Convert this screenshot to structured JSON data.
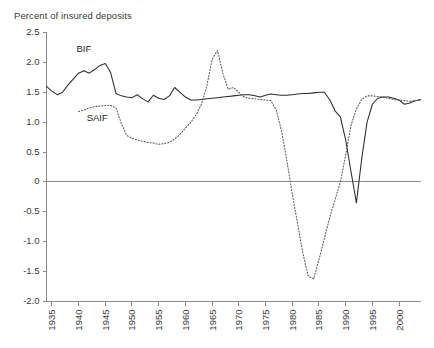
{
  "chart_data": {
    "type": "line",
    "title": "Percent of insured deposits",
    "xlabel": "",
    "ylabel": "Percent of insured deposits",
    "xlim": [
      1934,
      2004
    ],
    "ylim": [
      -2.0,
      2.5
    ],
    "grid": false,
    "legend_position": "inline-annotations",
    "yticks": [
      "2.5",
      "2.0",
      "1.5",
      "1.0",
      "0.5",
      "0",
      "-0.5",
      "-1.0",
      "-1.5",
      "-2.0"
    ],
    "ytick_values": [
      2.5,
      2.0,
      1.5,
      1.0,
      0.5,
      0,
      -0.5,
      -1.0,
      -1.5,
      -2.0
    ],
    "xticks": [
      "1935",
      "1940",
      "1945",
      "1950",
      "1955",
      "1960",
      "1965",
      "1970",
      "1975",
      "1980",
      "1985",
      "1990",
      "1995",
      "2000"
    ],
    "xtick_values": [
      1935,
      1940,
      1945,
      1950,
      1955,
      1960,
      1965,
      1970,
      1975,
      1980,
      1985,
      1990,
      1995,
      2000
    ],
    "annotations": [
      {
        "label": "BIF",
        "x": 1941,
        "y": 2.18
      },
      {
        "label": "SAIF",
        "x": 1943.5,
        "y": 1.02
      }
    ],
    "series": [
      {
        "name": "BIF",
        "style": "solid",
        "color": "#2b2b2b",
        "x": [
          1934,
          1935,
          1936,
          1937,
          1938,
          1939,
          1940,
          1941,
          1942,
          1943,
          1944,
          1945,
          1946,
          1947,
          1948,
          1949,
          1950,
          1951,
          1952,
          1953,
          1954,
          1955,
          1956,
          1957,
          1958,
          1959,
          1960,
          1961,
          1962,
          1963,
          1964,
          1965,
          1966,
          1967,
          1968,
          1969,
          1970,
          1971,
          1972,
          1973,
          1974,
          1975,
          1976,
          1977,
          1978,
          1979,
          1980,
          1981,
          1982,
          1983,
          1984,
          1985,
          1986,
          1987,
          1988,
          1989,
          1990,
          1991,
          1992,
          1993,
          1994,
          1995,
          1996,
          1997,
          1998,
          1999,
          2000,
          2001,
          2002,
          2003,
          2004
        ],
        "values": [
          1.6,
          1.52,
          1.46,
          1.5,
          1.62,
          1.72,
          1.82,
          1.86,
          1.82,
          1.88,
          1.95,
          1.98,
          1.83,
          1.48,
          1.44,
          1.42,
          1.41,
          1.46,
          1.39,
          1.34,
          1.45,
          1.4,
          1.38,
          1.44,
          1.58,
          1.5,
          1.42,
          1.37,
          1.37,
          1.38,
          1.39,
          1.4,
          1.41,
          1.42,
          1.43,
          1.44,
          1.45,
          1.46,
          1.46,
          1.44,
          1.42,
          1.45,
          1.47,
          1.46,
          1.45,
          1.45,
          1.46,
          1.47,
          1.48,
          1.48,
          1.49,
          1.5,
          1.5,
          1.38,
          1.19,
          1.09,
          0.7,
          0.17,
          -0.35,
          0.39,
          1.0,
          1.3,
          1.4,
          1.42,
          1.42,
          1.4,
          1.37,
          1.3,
          1.32,
          1.36,
          1.38
        ]
      },
      {
        "name": "SAIF",
        "style": "dotted",
        "color": "#555555",
        "x": [
          1940,
          1941,
          1942,
          1943,
          1944,
          1945,
          1946,
          1947,
          1948,
          1949,
          1950,
          1951,
          1952,
          1953,
          1954,
          1955,
          1956,
          1957,
          1958,
          1959,
          1960,
          1961,
          1962,
          1963,
          1964,
          1965,
          1966,
          1967,
          1968,
          1969,
          1970,
          1971,
          1972,
          1973,
          1974,
          1975,
          1976,
          1977,
          1978,
          1979,
          1980,
          1981,
          1982,
          1983,
          1984,
          1985,
          1986,
          1987,
          1988,
          1989,
          1990,
          1991,
          1992,
          1993,
          1994,
          1995,
          1996,
          1997,
          1998,
          1999,
          2000,
          2001,
          2002,
          2003,
          2004
        ],
        "values": [
          1.18,
          1.2,
          1.24,
          1.26,
          1.27,
          1.28,
          1.28,
          1.24,
          0.98,
          0.78,
          0.73,
          0.7,
          0.68,
          0.66,
          0.65,
          0.63,
          0.64,
          0.66,
          0.72,
          0.8,
          0.9,
          1.0,
          1.12,
          1.3,
          1.6,
          2.05,
          2.2,
          1.82,
          1.55,
          1.58,
          1.5,
          1.42,
          1.4,
          1.39,
          1.38,
          1.37,
          1.36,
          1.2,
          0.85,
          0.35,
          -0.2,
          -0.7,
          -1.2,
          -1.58,
          -1.62,
          -1.3,
          -0.95,
          -0.6,
          -0.3,
          0.0,
          0.45,
          0.95,
          1.22,
          1.38,
          1.44,
          1.44,
          1.43,
          1.42,
          1.4,
          1.38,
          1.37,
          1.36,
          1.35,
          1.36,
          1.37
        ]
      }
    ]
  }
}
